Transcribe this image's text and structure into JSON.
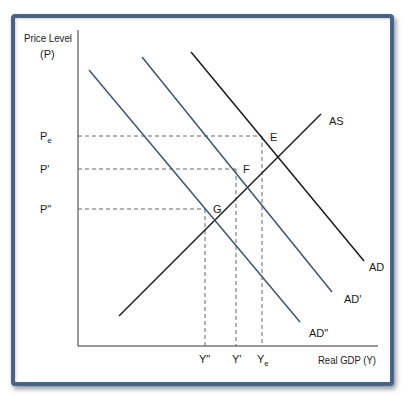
{
  "diagram": {
    "type": "AD-AS shift diagram",
    "y_axis_label_line1": "Price Level",
    "y_axis_label_line2": "(P)",
    "x_axis_label": "Real GDP (Y)",
    "price_ticks": [
      {
        "label": "P",
        "sub": "e",
        "y": 136
      },
      {
        "label": "P'",
        "sub": "",
        "y": 169
      },
      {
        "label": "P\"",
        "sub": "",
        "y": 209
      }
    ],
    "output_ticks": [
      {
        "label": "Y\"",
        "sub": "",
        "x": 205
      },
      {
        "label": "Y'",
        "sub": "",
        "x": 236
      },
      {
        "label": "Y",
        "sub": "e",
        "x": 262
      }
    ],
    "curves": [
      {
        "name": "AS",
        "label": "AS",
        "color": "#1a1a1a"
      },
      {
        "name": "AD",
        "label": "AD",
        "color": "#1a1a1a"
      },
      {
        "name": "AD'",
        "label": "AD'",
        "color": "#3d5574"
      },
      {
        "name": "AD\"",
        "label": "AD\"",
        "color": "#3d5574"
      }
    ],
    "points": [
      {
        "label": "E",
        "x": 262,
        "y": 136
      },
      {
        "label": "F",
        "x": 236,
        "y": 169
      },
      {
        "label": "G",
        "x": 205,
        "y": 209
      }
    ],
    "frame_color": "#4a6385"
  }
}
